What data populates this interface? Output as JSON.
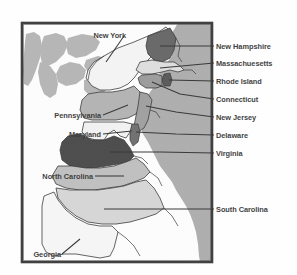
{
  "figure": {
    "type": "map",
    "title": "",
    "frame": {
      "border_color": "#1a1a1a",
      "background": "#ffffff"
    }
  },
  "map": {
    "water_label": "Great Lakes",
    "ocean_label": "Atlantic Ocean",
    "colors": {
      "ocean": "#9f9f9f",
      "lakes": "#a8a8a8",
      "land_unlabeled": "#fdfdfd",
      "new_york": "#f2f2f2",
      "new_hampshire": "#4c4c4c",
      "massachusetts": "#d8d8d8",
      "rhode_island": "#3c3c3c",
      "connecticut": "#8a8a8a",
      "new_jersey": "#8f8f8f",
      "delaware": "#565656",
      "pennsylvania": "#a6a6a6",
      "maryland": "#efefef",
      "virginia": "#2b2b2b",
      "north_carolina": "#b4b4b4",
      "south_carolina": "#cfcfcf",
      "georgia": "#f4f4f4",
      "outline": "#161616",
      "leader_line": "#121212",
      "label_text": "#151515"
    }
  },
  "labels": {
    "right": [
      {
        "name": "New Hampshire",
        "x": 216,
        "y": 49
      },
      {
        "name": "Massachuesetts",
        "x": 216,
        "y": 66
      },
      {
        "name": "Rhode Island",
        "x": 216,
        "y": 84
      },
      {
        "name": "Connecticut",
        "x": 216,
        "y": 102
      },
      {
        "name": "New Jersey",
        "x": 216,
        "y": 120
      },
      {
        "name": "Delaware",
        "x": 216,
        "y": 138
      },
      {
        "name": "Virginia",
        "x": 216,
        "y": 156
      },
      {
        "name": "South Carolina",
        "x": 216,
        "y": 212
      }
    ],
    "left": [
      {
        "name": "Pennsylvania",
        "x": 101,
        "y": 118
      },
      {
        "name": "Maryland",
        "x": 101,
        "y": 137
      },
      {
        "name": "North Carolina",
        "x": 93,
        "y": 179
      }
    ],
    "top": [
      {
        "name": "New York",
        "x": 88,
        "y": 40
      }
    ],
    "bottom": [
      {
        "name": "Georgia",
        "x": 43,
        "y": 256
      }
    ]
  },
  "states_depicted": [
    "New York",
    "New Hampshire",
    "Massachuesetts",
    "Rhode Island",
    "Connecticut",
    "New Jersey",
    "Delaware",
    "Pennsylvania",
    "Maryland",
    "Virginia",
    "North Carolina",
    "South Carolina",
    "Georgia"
  ]
}
